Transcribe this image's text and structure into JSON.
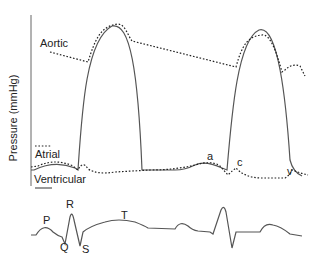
{
  "figure": {
    "y_axis_label": "Pressure (mmHg)",
    "traces": {
      "aortic": {
        "label": "Aortic",
        "style": "dotted"
      },
      "atrial": {
        "label": "Atrial",
        "style": "dotted"
      },
      "ventricular": {
        "label": "Ventricular",
        "style": "solid"
      }
    },
    "atrial_wave_labels": {
      "a": "a",
      "c": "c",
      "v": "v"
    },
    "ecg_labels": {
      "p": "P",
      "q": "Q",
      "r": "R",
      "s": "S",
      "t": "T"
    },
    "colors": {
      "line": "#555555",
      "text": "#222222",
      "background": "#ffffff"
    }
  }
}
